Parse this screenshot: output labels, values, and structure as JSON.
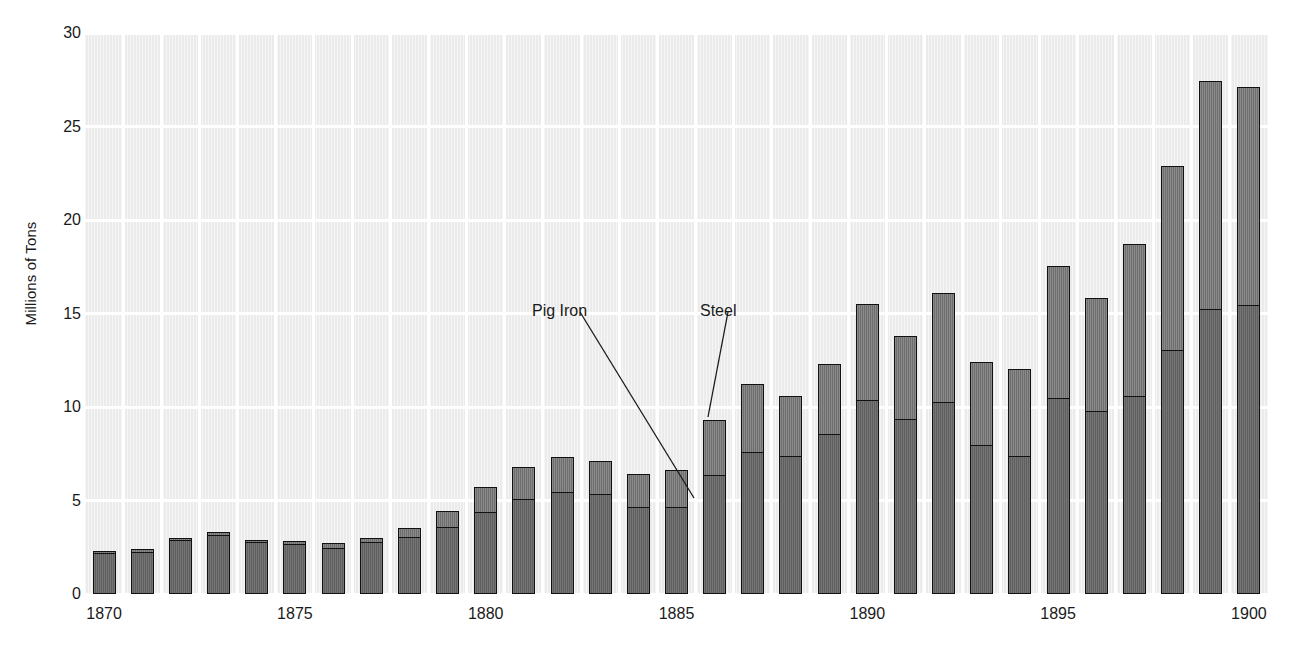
{
  "chart_data": {
    "type": "bar",
    "stacked": true,
    "title": "",
    "xlabel": "",
    "ylabel": "Millions of Tons",
    "ylim": [
      0,
      30
    ],
    "yticks": [
      0,
      5,
      10,
      15,
      20,
      25,
      30
    ],
    "xticks": [
      "1870",
      "1875",
      "1880",
      "1885",
      "1890",
      "1895",
      "1900"
    ],
    "grid": true,
    "legend_position": "annotation-callouts",
    "categories": [
      1870,
      1871,
      1872,
      1873,
      1874,
      1875,
      1876,
      1877,
      1878,
      1879,
      1880,
      1881,
      1882,
      1883,
      1884,
      1885,
      1886,
      1887,
      1888,
      1889,
      1890,
      1891,
      1892,
      1893,
      1894,
      1895,
      1896,
      1897,
      1898,
      1899,
      1900
    ],
    "series": [
      {
        "name": "Pig Iron",
        "color": "#656565",
        "values": [
          2.2,
          2.3,
          2.9,
          3.2,
          2.8,
          2.7,
          2.5,
          2.8,
          3.1,
          3.6,
          4.4,
          5.1,
          5.5,
          5.4,
          4.7,
          4.7,
          6.4,
          7.6,
          7.4,
          8.6,
          10.4,
          9.4,
          10.3,
          8.0,
          7.4,
          10.5,
          9.8,
          10.6,
          13.1,
          15.3,
          15.5
        ]
      },
      {
        "name": "Steel",
        "color": "#747474",
        "values": [
          0.2,
          0.2,
          0.2,
          0.2,
          0.2,
          0.2,
          0.3,
          0.3,
          0.5,
          0.9,
          1.4,
          1.8,
          1.9,
          1.8,
          1.8,
          2.0,
          3.0,
          3.7,
          3.3,
          3.8,
          5.2,
          4.5,
          5.9,
          4.5,
          4.7,
          7.1,
          6.1,
          8.2,
          9.9,
          12.2,
          11.7
        ]
      }
    ],
    "totals": [
      2.4,
      2.5,
      3.1,
      3.4,
      3.0,
      2.9,
      2.8,
      3.0,
      3.6,
      4.5,
      5.8,
      6.9,
      7.4,
      7.2,
      6.5,
      6.7,
      9.4,
      11.3,
      10.7,
      12.4,
      15.6,
      13.9,
      16.2,
      12.5,
      12.1,
      17.6,
      15.9,
      18.8,
      23.0,
      27.5,
      27.2
    ],
    "annotations": [
      {
        "label": "Pig Iron",
        "text_x": 532,
        "text_y": 303,
        "line_x1": 580,
        "line_y1": 312,
        "line_x2": 694,
        "line_y2": 498
      },
      {
        "label": "Steel",
        "text_x": 700,
        "text_y": 303,
        "line_x1": 728,
        "line_y1": 312,
        "line_x2": 708,
        "line_y2": 417
      }
    ]
  }
}
